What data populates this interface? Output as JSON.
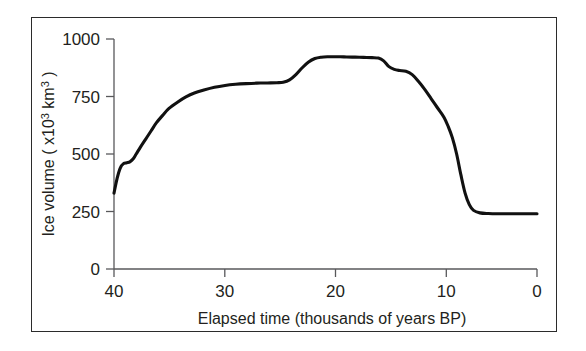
{
  "figure": {
    "border_color": "#2b2b2b",
    "background": "#ffffff",
    "curve_color": "#111111",
    "axis_color": "#58585b"
  },
  "chart_data": {
    "type": "line",
    "title": "",
    "xlabel": "Elapsed time (thousands of years BP)",
    "ylabel_parts": {
      "prefix": "Ice volume ( x10",
      "exponent": "3",
      "unit": " km",
      "unit_exponent": "3",
      "suffix": " )"
    },
    "ylabel": "Ice volume ( x10³ km³ )",
    "xlim": [
      40,
      0
    ],
    "ylim": [
      0,
      1000
    ],
    "x_reversed": true,
    "grid": false,
    "legend": "none",
    "xticks": [
      "40",
      "30",
      "20",
      "10",
      "0"
    ],
    "xtick_values": [
      40,
      30,
      20,
      10,
      0
    ],
    "yticks": [
      "0",
      "250",
      "500",
      "750",
      "1000"
    ],
    "ytick_values": [
      0,
      250,
      500,
      750,
      1000
    ],
    "series": [
      {
        "name": "Ice volume",
        "x": [
          40.0,
          39.7,
          39.4,
          39.1,
          38.8,
          38.5,
          38.2,
          37.9,
          37.5,
          37.0,
          36.5,
          36.0,
          35.4,
          34.8,
          34.0,
          33.2,
          32.4,
          31.5,
          30.5,
          29.5,
          28.5,
          27.5,
          26.5,
          25.5,
          24.6,
          24.0,
          23.4,
          22.8,
          22.2,
          21.6,
          21.0,
          20.4,
          19.8,
          19.2,
          18.6,
          18.0,
          17.2,
          16.4,
          15.6,
          15.0,
          14.5,
          14.0,
          13.5,
          13.0,
          12.4,
          11.8,
          11.2,
          10.6,
          10.0,
          9.4,
          8.8,
          8.4,
          8.0,
          7.6,
          7.2,
          6.8,
          6.4,
          6.0,
          5.4,
          4.6,
          3.6,
          2.6,
          1.6,
          0.8,
          0.0
        ],
        "y": [
          330,
          395,
          440,
          458,
          462,
          466,
          478,
          500,
          530,
          565,
          600,
          635,
          668,
          698,
          725,
          748,
          765,
          778,
          790,
          798,
          803,
          806,
          808,
          809,
          810,
          812,
          822,
          845,
          875,
          900,
          915,
          921,
          923,
          923,
          923,
          922,
          921,
          920,
          919,
          917,
          905,
          880,
          868,
          863,
          860,
          845,
          815,
          780,
          740,
          700,
          660,
          620,
          570,
          500,
          410,
          330,
          280,
          255,
          244,
          241,
          240,
          240,
          240,
          240,
          240
        ]
      }
    ],
    "annotations": []
  }
}
